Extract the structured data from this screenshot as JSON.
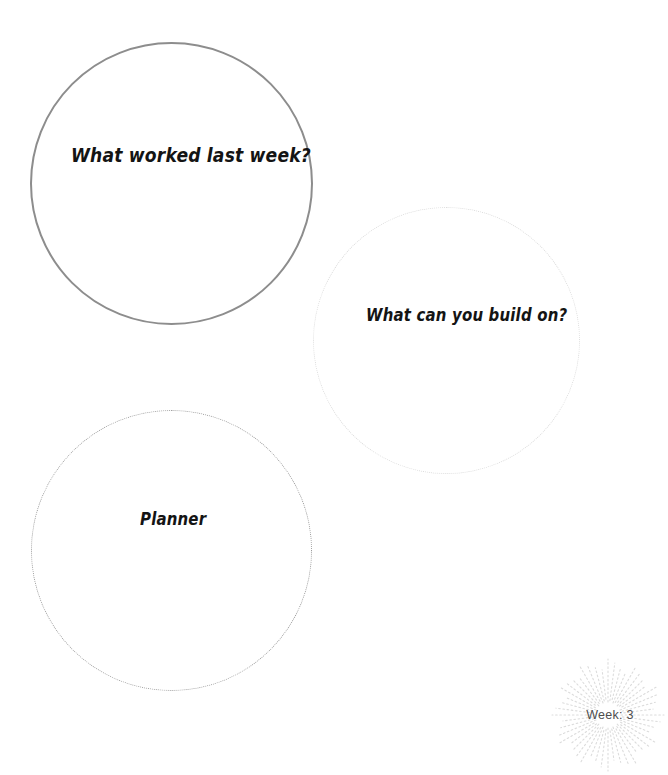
{
  "page": {
    "background_color": "#ffffff",
    "width": 649,
    "height": 758
  },
  "bubbles": [
    {
      "id": "what-worked-last-week",
      "label": "What worked last week?",
      "border_style": "solid",
      "border_color": "#8d8d8d",
      "selected": true
    },
    {
      "id": "what-can-you-build-on",
      "label": "What can you build on?",
      "border_style": "dotted",
      "border_color": "#dcdcdc",
      "selected": false
    },
    {
      "id": "planner",
      "label": "Planner",
      "border_style": "dotted",
      "border_color": "#9a9a9a",
      "selected": false
    }
  ],
  "badge": {
    "icon": "sunburst-icon",
    "label": "Week: 3",
    "ray_color": "#dcdcdc",
    "text_color": "#4d4d4d"
  }
}
